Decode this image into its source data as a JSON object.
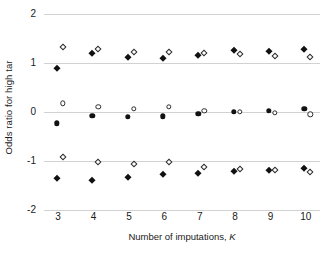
{
  "chart_data": {
    "type": "scatter",
    "title": "",
    "xlabel": "Number of imputations, K",
    "xlabel_plain": "Number of imputations,",
    "xlabel_italic": "K",
    "ylabel": "Odds ratio for high tar",
    "xlim": [
      2.6,
      10.4
    ],
    "ylim": [
      -2,
      2
    ],
    "xticks": [
      3,
      4,
      5,
      6,
      7,
      8,
      9,
      10
    ],
    "xticklabels": [
      "3",
      "4",
      "5",
      "6",
      "7",
      "8",
      "9",
      "10"
    ],
    "yticks": [
      -2,
      -1,
      0,
      1,
      2
    ],
    "yticklabels": [
      "-2",
      "-1",
      "0",
      "1",
      "2"
    ],
    "grid": "horizontal",
    "grid_color": "#d2d2d2",
    "legend": "none",
    "marker_offset": 0.13,
    "x": [
      3,
      4,
      5,
      6,
      7,
      8,
      9,
      10
    ],
    "series": [
      {
        "name": "upper-limit-filled",
        "marker": "diamond-filled",
        "color": "#111111",
        "x_offset": -0.04,
        "values": [
          0.9,
          1.21,
          1.13,
          1.1,
          1.16,
          1.26,
          1.25,
          1.29
        ]
      },
      {
        "name": "upper-limit-open",
        "marker": "diamond-open",
        "color": "#2b2b2b",
        "x_offset": 0.13,
        "values": [
          1.33,
          1.28,
          1.23,
          1.23,
          1.21,
          1.18,
          1.15,
          1.13
        ]
      },
      {
        "name": "estimate-filled",
        "marker": "circle-filled",
        "color": "#111111",
        "x_offset": -0.04,
        "values": [
          -0.23,
          -0.08,
          -0.1,
          -0.09,
          -0.04,
          0.0,
          0.03,
          0.06
        ]
      },
      {
        "name": "estimate-open",
        "marker": "circle-open",
        "color": "#2b2b2b",
        "x_offset": 0.13,
        "values": [
          0.18,
          0.11,
          0.07,
          0.1,
          0.03,
          0.0,
          -0.02,
          -0.05
        ]
      },
      {
        "name": "lower-limit-filled",
        "marker": "diamond-filled",
        "color": "#111111",
        "x_offset": -0.04,
        "values": [
          -1.35,
          -1.38,
          -1.32,
          -1.27,
          -1.24,
          -1.21,
          -1.18,
          -1.14
        ]
      },
      {
        "name": "lower-limit-open",
        "marker": "diamond-open",
        "color": "#2b2b2b",
        "x_offset": 0.13,
        "values": [
          -0.91,
          -1.02,
          -1.06,
          -1.02,
          -1.12,
          -1.16,
          -1.18,
          -1.23
        ]
      }
    ]
  }
}
